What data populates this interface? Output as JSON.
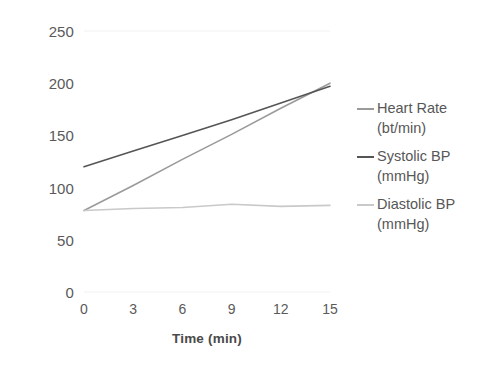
{
  "chart_data": {
    "type": "line",
    "title": "",
    "xlabel": "Time (min)",
    "ylabel": "",
    "x": [
      0,
      3,
      6,
      9,
      12,
      15
    ],
    "xlim": [
      0,
      15
    ],
    "ylim": [
      0,
      250
    ],
    "yticks": [
      0,
      50,
      100,
      150,
      200,
      250
    ],
    "xticks": [
      0,
      3,
      6,
      9,
      12,
      15
    ],
    "grid": false,
    "legend_position": "right",
    "series": [
      {
        "name": "Heart Rate (bt/min)",
        "color": "#9a9a9a",
        "values": [
          78,
          102,
          127,
          151,
          176,
          200
        ]
      },
      {
        "name": "Systolic BP (mmHg)",
        "color": "#555555",
        "values": [
          120,
          135,
          150,
          165,
          181,
          197
        ]
      },
      {
        "name": "Diastolic BP (mmHg)",
        "color": "#c9c9c9",
        "values": [
          78,
          80,
          81,
          84,
          82,
          83
        ]
      }
    ]
  },
  "axes": {
    "y_ticks": [
      {
        "label": "250",
        "value": 250
      },
      {
        "label": "200",
        "value": 200
      },
      {
        "label": "150",
        "value": 150
      },
      {
        "label": "100",
        "value": 100
      },
      {
        "label": "50",
        "value": 50
      },
      {
        "label": "0",
        "value": 0
      }
    ],
    "x_ticks": [
      {
        "label": "0",
        "value": 0
      },
      {
        "label": "3",
        "value": 3
      },
      {
        "label": "6",
        "value": 6
      },
      {
        "label": "9",
        "value": 9
      },
      {
        "label": "12",
        "value": 12
      },
      {
        "label": "15",
        "value": 15
      }
    ],
    "x_title": "Time (min)"
  },
  "legend": {
    "items": [
      {
        "label": "Heart Rate\n(bt/min)",
        "color": "#9a9a9a"
      },
      {
        "label": "Systolic BP\n(mmHg)",
        "color": "#555555"
      },
      {
        "label": "Diastolic BP\n(mmHg)",
        "color": "#c9c9c9"
      }
    ]
  },
  "style": {
    "background": "#ffffff",
    "gridline_color": "#f2f2f2",
    "axis_text_color": "#5a5a5a"
  }
}
